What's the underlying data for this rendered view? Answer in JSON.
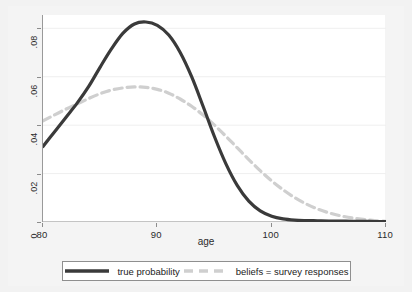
{
  "chart_data": {
    "type": "line",
    "title": "",
    "subtitle": "",
    "xlabel": "age",
    "ylabel": "",
    "xlim": [
      80,
      110
    ],
    "ylim": [
      0,
      0.0855
    ],
    "grid": true,
    "grid_orientation": "horizontal",
    "legend_position": "below-plot",
    "x_ticks": [
      80,
      90,
      100,
      110
    ],
    "x_tick_labels": [
      "80",
      "90",
      "100",
      "110"
    ],
    "y_ticks": [
      0,
      0.02,
      0.04,
      0.06,
      0.08
    ],
    "y_tick_labels": [
      "0",
      ".02",
      ".04",
      ".06",
      ".08"
    ],
    "series": [
      {
        "name": "true probability",
        "color": "#3a3a3a",
        "style": "solid",
        "width": 3.2,
        "x": [
          80,
          81,
          82,
          83,
          84,
          85,
          86,
          87,
          88,
          89,
          90,
          91,
          92,
          93,
          94,
          95,
          96,
          97,
          98,
          99,
          100,
          101,
          102,
          103,
          104,
          105,
          106,
          107,
          108,
          109,
          110
        ],
        "values": [
          0.0312,
          0.0372,
          0.0432,
          0.0492,
          0.056,
          0.064,
          0.0716,
          0.078,
          0.0818,
          0.0826,
          0.0812,
          0.0772,
          0.07,
          0.06,
          0.0478,
          0.0352,
          0.024,
          0.015,
          0.0086,
          0.0046,
          0.0024,
          0.0013,
          0.0008,
          0.0006,
          0.0005,
          0.0004,
          0.0004,
          0.0003,
          0.0003,
          0.0002,
          0.0002
        ]
      },
      {
        "name": "beliefs = survey responses",
        "color": "#cfcfcf",
        "style": "dashed",
        "width": 3.2,
        "dash": "8,5",
        "x": [
          80,
          81,
          82,
          83,
          84,
          85,
          86,
          87,
          88,
          89,
          90,
          91,
          92,
          93,
          94,
          95,
          96,
          97,
          98,
          99,
          100,
          101,
          102,
          103,
          104,
          105,
          106,
          107,
          108,
          109,
          110
        ],
        "values": [
          0.0418,
          0.0442,
          0.0466,
          0.0488,
          0.051,
          0.053,
          0.0545,
          0.0554,
          0.0558,
          0.0556,
          0.0548,
          0.0532,
          0.0508,
          0.0478,
          0.0442,
          0.04,
          0.0354,
          0.0306,
          0.0258,
          0.0212,
          0.017,
          0.0133,
          0.0101,
          0.0075,
          0.0054,
          0.0038,
          0.0026,
          0.0017,
          0.0011,
          0.0006,
          0.0003
        ]
      }
    ],
    "legend": [
      {
        "label": "true probability",
        "color": "#3a3a3a",
        "style": "solid"
      },
      {
        "label": "beliefs = survey responses",
        "color": "#cfcfcf",
        "style": "dashed"
      }
    ]
  },
  "colors": {
    "figure_background": "#f2f2f2",
    "plot_background": "#ffffff",
    "axis": "#9a9a9a",
    "grid": "#efefef",
    "tick_text": "#2b2b2b",
    "legend_border": "#8f8f8f",
    "true_probability": "#3a3a3a",
    "beliefs": "#cfcfcf"
  }
}
